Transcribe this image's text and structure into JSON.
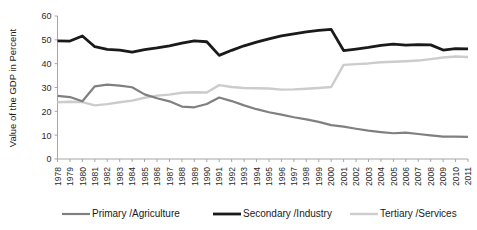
{
  "chart_data": {
    "type": "line",
    "title": "",
    "xlabel": "",
    "ylabel": "Value of the GDP in Percent",
    "ylim": [
      0,
      60
    ],
    "yticks": [
      0,
      10,
      20,
      30,
      40,
      50,
      60
    ],
    "grid": false,
    "legend_position": "bottom",
    "categories": [
      "1978",
      "1979",
      "1980",
      "1981",
      "1982",
      "1983",
      "1984",
      "1985",
      "1986",
      "1987",
      "1988",
      "1989",
      "1990",
      "1991",
      "1992",
      "1993",
      "1994",
      "1995",
      "1996",
      "1997",
      "1998",
      "1999",
      "2000",
      "2001",
      "2002",
      "2003",
      "2004",
      "2005",
      "2006",
      "2007",
      "2008",
      "2009",
      "2010",
      "2011"
    ],
    "series": [
      {
        "name": "Primary /Agriculture",
        "color": "#808080",
        "width": 2.2,
        "values": [
          26.5,
          26.0,
          24.2,
          30.5,
          31.2,
          30.8,
          30.1,
          27.1,
          25.5,
          24.2,
          22.0,
          21.7,
          23.1,
          25.8,
          24.3,
          22.5,
          20.9,
          19.6,
          18.6,
          17.5,
          16.6,
          15.6,
          14.2,
          13.6,
          12.7,
          11.9,
          11.3,
          10.8,
          11.1,
          10.5,
          9.9,
          9.4,
          9.4,
          9.3
        ]
      },
      {
        "name": "Secondary /Industry",
        "color": "#1a1a1a",
        "width": 2.8,
        "values": [
          49.6,
          49.5,
          51.6,
          47.1,
          46.0,
          45.7,
          44.8,
          45.9,
          46.6,
          47.5,
          48.6,
          49.6,
          49.2,
          43.5,
          45.6,
          47.5,
          49.0,
          50.4,
          51.7,
          52.5,
          53.3,
          54.0,
          54.4,
          45.5,
          46.1,
          46.8,
          47.7,
          48.2,
          47.8,
          48.0,
          47.9,
          45.7,
          46.3,
          46.2
        ]
      },
      {
        "name": "Tertiary /Services",
        "color": "#cccccc",
        "width": 2.4,
        "values": [
          23.8,
          24.0,
          23.9,
          22.5,
          23.0,
          23.8,
          24.5,
          25.7,
          26.6,
          27.0,
          27.8,
          28.0,
          27.9,
          31.0,
          30.2,
          29.8,
          29.7,
          29.6,
          29.1,
          29.2,
          29.5,
          29.8,
          30.2,
          39.5,
          39.8,
          40.1,
          40.6,
          40.8,
          41.0,
          41.3,
          41.9,
          42.6,
          43.0,
          42.8
        ]
      }
    ]
  },
  "legend": {
    "items": [
      {
        "label": "Primary /Agriculture"
      },
      {
        "label": "Secondary /Industry"
      },
      {
        "label": "Tertiary /Services"
      }
    ]
  }
}
